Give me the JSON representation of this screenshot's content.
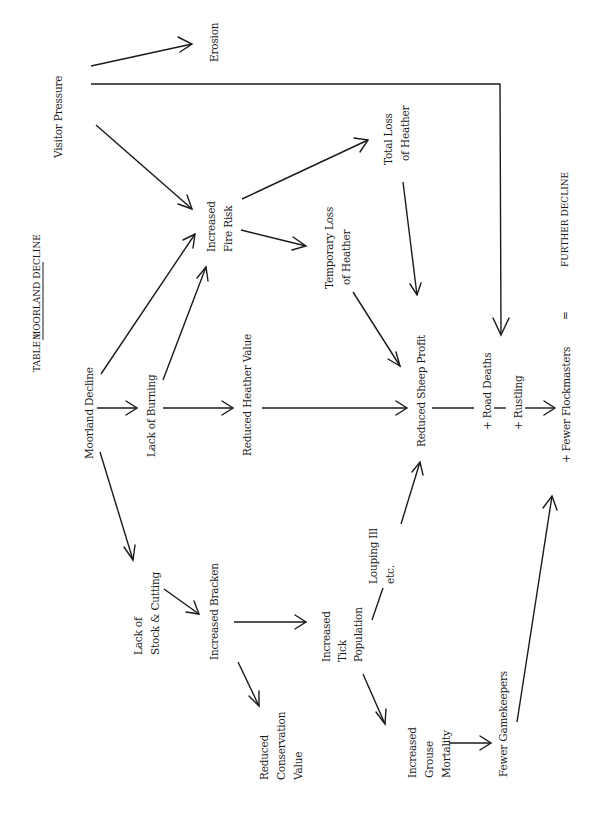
{
  "title": {
    "prefix": "TABLE 1",
    "name": "MOORLAND DECLINE"
  },
  "nodes": {
    "visitor_pressure": [
      "Visitor Pressure"
    ],
    "erosion": [
      "Erosion"
    ],
    "increased_fire_risk": [
      "Increased",
      "Fire Risk"
    ],
    "total_loss_heather": [
      "Total Loss",
      "of Heather"
    ],
    "temporary_loss_heather": [
      "Temporary Loss",
      "of Heather"
    ],
    "moorland_decline": [
      "Moorland Decline"
    ],
    "lack_of_burning": [
      "Lack of Burning"
    ],
    "reduced_heather_value": [
      "Reduced Heather Value"
    ],
    "reduced_sheep_profit": [
      "Reduced Sheep Profit"
    ],
    "road_deaths": [
      "+ Road Deaths"
    ],
    "rustling": [
      "+ Rustling"
    ],
    "fewer_flockmasters": [
      "+ Fewer Flockmasters"
    ],
    "equals": [
      "="
    ],
    "further_decline": [
      "FURTHER DECLINE"
    ],
    "lack_of_stock_cutting": [
      "Lack of",
      "Stock & Cutting"
    ],
    "increased_bracken": [
      "Increased Bracken"
    ],
    "louping_ill": [
      "Louping Ill",
      "etc."
    ],
    "increased_tick_population": [
      "Increased",
      "Tick",
      "Population"
    ],
    "reduced_conservation_value": [
      "Reduced",
      "Conservation",
      "Value"
    ],
    "increased_grouse_mortality": [
      "Increased",
      "Grouse",
      "Mortality"
    ],
    "fewer_gamekeepers": [
      "Fewer Gamekeepers"
    ]
  },
  "edges": [
    {
      "from": "visitor_pressure",
      "to": "erosion"
    },
    {
      "from": "visitor_pressure",
      "to": "road_deaths"
    },
    {
      "from": "visitor_pressure",
      "to": "increased_fire_risk"
    },
    {
      "from": "moorland_decline",
      "to": "increased_fire_risk"
    },
    {
      "from": "moorland_decline",
      "to": "lack_of_burning"
    },
    {
      "from": "moorland_decline",
      "to": "lack_of_stock_cutting"
    },
    {
      "from": "lack_of_burning",
      "to": "increased_fire_risk"
    },
    {
      "from": "lack_of_burning",
      "to": "reduced_heather_value"
    },
    {
      "from": "increased_fire_risk",
      "to": "total_loss_heather"
    },
    {
      "from": "increased_fire_risk",
      "to": "temporary_loss_heather"
    },
    {
      "from": "total_loss_heather",
      "to": "reduced_sheep_profit"
    },
    {
      "from": "temporary_loss_heather",
      "to": "reduced_sheep_profit"
    },
    {
      "from": "reduced_heather_value",
      "to": "reduced_sheep_profit"
    },
    {
      "from": "reduced_sheep_profit",
      "to": "fewer_flockmasters"
    },
    {
      "from": "lack_of_stock_cutting",
      "to": "increased_bracken"
    },
    {
      "from": "increased_bracken",
      "to": "increased_tick_population"
    },
    {
      "from": "increased_bracken",
      "to": "reduced_conservation_value"
    },
    {
      "from": "increased_tick_population",
      "to": "reduced_sheep_profit",
      "via": "louping_ill"
    },
    {
      "from": "increased_tick_population",
      "to": "increased_grouse_mortality"
    },
    {
      "from": "increased_grouse_mortality",
      "to": "fewer_gamekeepers"
    },
    {
      "from": "fewer_gamekeepers",
      "to": "fewer_flockmasters"
    }
  ]
}
